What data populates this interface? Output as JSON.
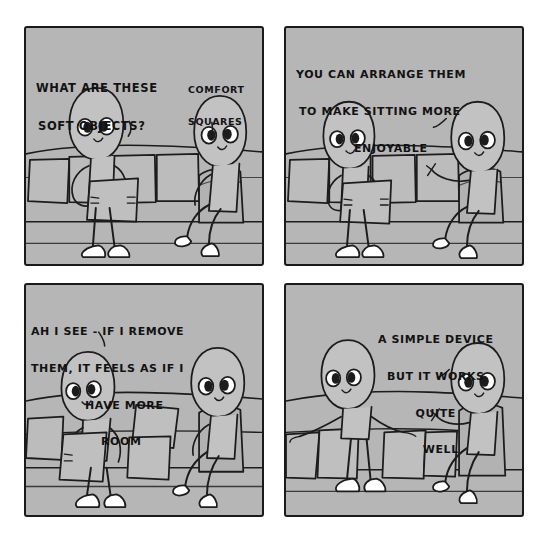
{
  "comic": {
    "title": "Strange Planet - Comfort Squares",
    "background_color": "#ffffff",
    "panel_fill": "#b6b6b6",
    "ink_color": "#1a1a1a",
    "panels": [
      {
        "id": "panel-1",
        "order": 1,
        "dialogue": [
          {
            "speaker": "left-being",
            "lines": [
              "WHAT ARE THESE",
              "SOFT OBJECTS?"
            ]
          },
          {
            "speaker": "right-being",
            "lines": [
              "COMFORT",
              "SQUARES"
            ]
          }
        ],
        "scene": "Two beings near a couch; the left being holds a cushion while standing, the right being sits on the couch armrest."
      },
      {
        "id": "panel-2",
        "order": 2,
        "dialogue": [
          {
            "speaker": "right-being",
            "lines": [
              "YOU CAN ARRANGE THEM",
              "TO MAKE SITTING MORE",
              "ENJOYABLE"
            ]
          }
        ],
        "scene": "The right being gestures with one hand while explaining; the left being still holds the cushion."
      },
      {
        "id": "panel-3",
        "order": 3,
        "dialogue": [
          {
            "speaker": "left-being",
            "lines": [
              "AH I SEE - IF I REMOVE",
              "THEM, IT FEELS AS IF I",
              "HAVE MORE",
              "ROOM"
            ]
          }
        ],
        "scene": "Cushions have been pulled off the couch and dropped on the floor."
      },
      {
        "id": "panel-4",
        "order": 4,
        "dialogue": [
          {
            "speaker": "right-being",
            "lines": [
              "A SIMPLE DEVICE",
              "BUT IT WORKS",
              "QUITE",
              "WELL"
            ]
          }
        ],
        "scene": "Both beings lounge on the bare couch with every cushion on the floor."
      }
    ]
  }
}
